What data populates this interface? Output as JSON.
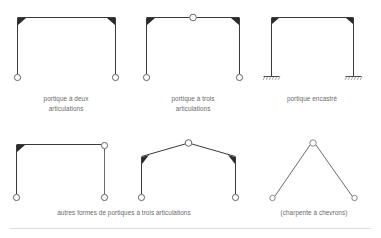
{
  "figure": {
    "background_color": "#ffffff",
    "line_color": "#3a3a3a",
    "caption_color": "#6b6b6b",
    "hinge_fill": "#ffffff",
    "haunch_color": "#2b2b2b",
    "rule_color": "#d8d8d8"
  },
  "captions": {
    "frame1_line1": "portique à deux",
    "frame1_line2": "articulations",
    "frame2_line1": "portique à trois",
    "frame2_line2": "articulations",
    "frame3_line1": "portique encastré",
    "bottom_left": "autres formes de portiques à trois articulations",
    "bottom_right": "(charpente à chevrons)"
  },
  "frames": [
    {
      "id": "frame-two-hinged",
      "name": "portique à deux articulations",
      "shape": "rectangular-portal",
      "supports": "pinned",
      "hinges": 2,
      "hinge_positions": [
        "base-left",
        "base-right"
      ],
      "haunches": [
        "corner-left",
        "corner-right"
      ]
    },
    {
      "id": "frame-three-hinged",
      "name": "portique à trois articulations",
      "shape": "rectangular-portal",
      "supports": "pinned",
      "hinges": 3,
      "hinge_positions": [
        "base-left",
        "base-right",
        "beam-midspan"
      ],
      "haunches": [
        "corner-left",
        "corner-right"
      ]
    },
    {
      "id": "frame-fixed",
      "name": "portique encastré",
      "shape": "rectangular-portal",
      "supports": "fixed",
      "hinges": 0,
      "hinge_positions": [],
      "haunches": [
        "corner-left",
        "corner-right"
      ]
    },
    {
      "id": "frame-corner-hinge",
      "name": "portique à trois articulations (angle)",
      "shape": "rectangular-portal",
      "supports": "pinned",
      "hinges": 3,
      "hinge_positions": [
        "base-left",
        "base-right",
        "corner-right"
      ],
      "haunches": [
        "corner-left"
      ]
    },
    {
      "id": "frame-gabled",
      "name": "portique à trois articulations (à deux versants)",
      "shape": "gabled-portal",
      "supports": "pinned",
      "hinges": 3,
      "hinge_positions": [
        "base-left",
        "base-right",
        "ridge"
      ],
      "haunches": [
        "corner-left",
        "corner-right"
      ]
    },
    {
      "id": "frame-rafter",
      "name": "charpente à chevrons",
      "shape": "a-frame-rafter",
      "supports": "pinned",
      "hinges": 3,
      "hinge_positions": [
        "base-left",
        "base-right",
        "ridge"
      ],
      "haunches": []
    }
  ]
}
